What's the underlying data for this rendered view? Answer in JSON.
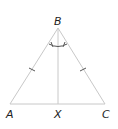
{
  "diagram": {
    "type": "isosceles-triangle",
    "points": {
      "A": {
        "label": "A",
        "x": 10,
        "y": 104
      },
      "B": {
        "label": "B",
        "x": 58,
        "y": 28
      },
      "C": {
        "label": "C",
        "x": 105,
        "y": 104
      },
      "X": {
        "label": "X",
        "x": 58,
        "y": 104
      }
    },
    "segments": [
      "AB",
      "BC",
      "AC",
      "BX"
    ],
    "equal_sides": [
      "AB",
      "BC"
    ],
    "equal_angles": [
      "ABX",
      "XBC"
    ],
    "colors": {
      "stroke": "#c8c8c8",
      "label": "#222222"
    }
  }
}
